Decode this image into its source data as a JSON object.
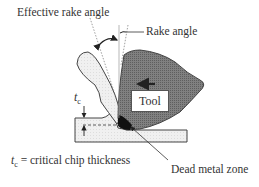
{
  "figure": {
    "labels": {
      "effective_rake_angle": "Effective rake angle",
      "rake_angle": "Rake angle",
      "tool": "Tool",
      "tc_symbol": "t",
      "tc_subscript": "c",
      "definition_symbol": "t",
      "definition_subscript": "c",
      "definition_text": " = critical chip thickness",
      "dead_metal_zone": "Dead metal zone"
    },
    "colors": {
      "tool_fill": "#7a7a7a",
      "workpiece_fill": "#eeeeee",
      "dead_metal_zone": "#111111",
      "outline": "#444444"
    }
  }
}
